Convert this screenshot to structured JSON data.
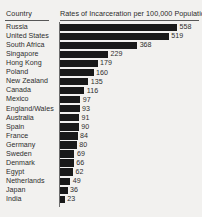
{
  "header": {
    "country_label": "Country",
    "title": "Rates of Incarceration per 100,000 Population"
  },
  "chart_data": {
    "type": "bar",
    "orientation": "horizontal",
    "title": "Rates of Incarceration per 100,000 Population",
    "xlabel": "",
    "ylabel": "Country",
    "grid": false,
    "legend": null,
    "xlim": [
      0,
      558
    ],
    "categories": [
      "Russia",
      "United States",
      "South Africa",
      "Singapore",
      "Hong Kong",
      "Poland",
      "New Zealand",
      "Canada",
      "Mexico",
      "England/Wales",
      "Australia",
      "Spain",
      "France",
      "Germany",
      "Sweden",
      "Denmark",
      "Egypt",
      "Netherlands",
      "Japan",
      "India"
    ],
    "values": [
      558,
      519,
      368,
      229,
      179,
      160,
      135,
      116,
      97,
      93,
      91,
      90,
      84,
      80,
      69,
      66,
      62,
      49,
      36,
      23
    ],
    "value_labels": [
      "558",
      "519",
      "368",
      "229",
      "179",
      "160",
      "135",
      "116",
      "97",
      "93",
      "91",
      "90",
      "84",
      "80",
      "69",
      "66",
      "62",
      "49",
      "36",
      "23"
    ],
    "bar_color": "#191919",
    "background_color": "#f2f1ef"
  }
}
